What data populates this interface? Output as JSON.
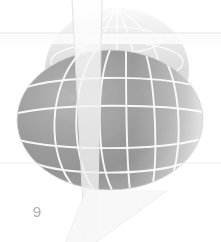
{
  "page": {
    "page_number": "9",
    "background_color": "#ffffff",
    "width": 221,
    "height": 242
  },
  "figure": {
    "name": "wireframe-globe-with-cutting-planes",
    "caption": "",
    "colors": {
      "sphere_dark": "#8f8f8f",
      "sphere_mid": "#a6a6a6",
      "sphere_light": "#cfcfcf",
      "sphere_highlight": "#e8e8e8",
      "grid_line": "#ffffff",
      "plane_fill": "#f2f2f2",
      "plane_edge": "#e4e4e4",
      "faded_dome": "#dcdcdc",
      "page_number_color": "#b0b0b0"
    },
    "sphere": {
      "center_x": 110,
      "center_y": 120,
      "radius_x": 93,
      "radius_y": 70,
      "latitude_count": 4,
      "longitude_count": 6
    },
    "faded_dome": {
      "center_x": 117,
      "center_y": 70,
      "radius_x": 72,
      "radius_y": 62
    },
    "vertical_plane": {
      "top_left_x": 72,
      "top_right_x": 102,
      "bottom_left_x": 85,
      "bottom_right_x": 97
    },
    "horizontal_plane": {
      "edge_y": 33,
      "lower_edge_y": 163
    }
  }
}
